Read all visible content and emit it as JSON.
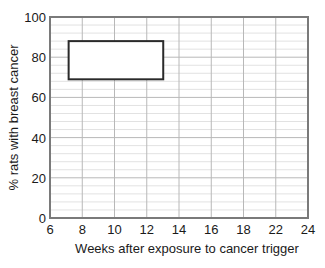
{
  "chart_data": {
    "type": "bar",
    "title": "",
    "xlabel": "Weeks after exposure to cancer trigger",
    "ylabel": "% rats with breast cancer",
    "xlim": [
      6,
      24
    ],
    "ylim": [
      0,
      100
    ],
    "x_tick_labels": [
      "6",
      "8",
      "10",
      "12",
      "14",
      "16",
      "18",
      "22",
      "24"
    ],
    "y_tick_labels": [
      "0",
      "20",
      "40",
      "60",
      "80",
      "100"
    ],
    "y_ticks": [
      0,
      20,
      40,
      60,
      80,
      100
    ],
    "y_minor_step": 4,
    "grid": true,
    "legend": "none",
    "series": [
      {
        "name": "range box",
        "x_start": 7.3,
        "x_end": 13.9,
        "y_low": 69,
        "y_high": 88
      }
    ],
    "colors": {
      "axis": "#7a7a7a",
      "major_grid": "#b8b8b8",
      "minor_grid": "#e2e2e2",
      "box_stroke": "#2a2a2a",
      "box_fill": "#ffffff"
    }
  }
}
